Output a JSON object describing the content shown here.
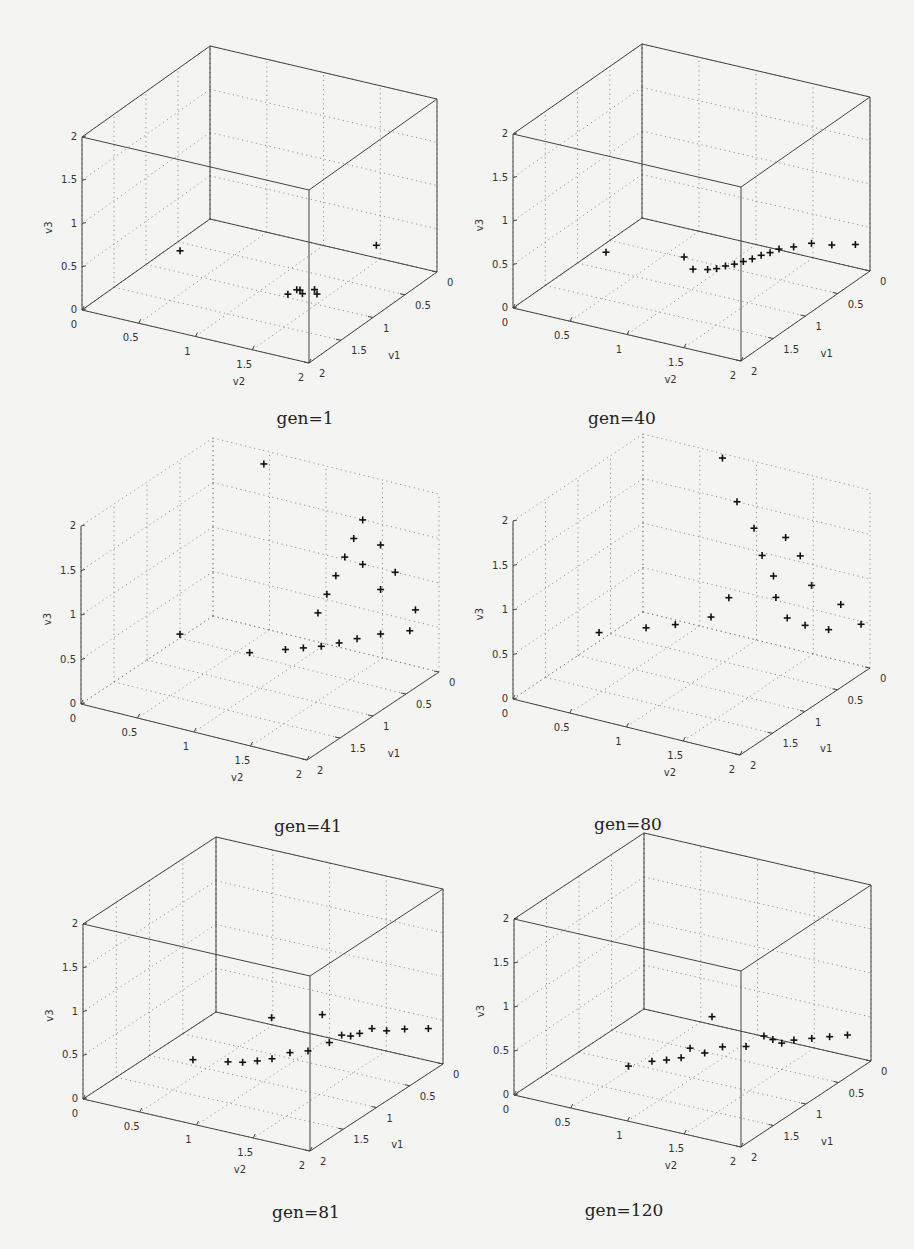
{
  "figure": {
    "panels": [
      {
        "caption": "gen=1"
      },
      {
        "caption": "gen=40"
      },
      {
        "caption": "gen=41"
      },
      {
        "caption": "gen=80"
      },
      {
        "caption": "gen=81"
      },
      {
        "caption": "gen=120"
      }
    ]
  },
  "chart_data": [
    {
      "type": "scatter3d",
      "title": "gen=1",
      "xlabel": "v1",
      "ylabel": "v2",
      "zlabel": "v3",
      "xlim": [
        0,
        2
      ],
      "ylim": [
        0,
        2
      ],
      "zlim": [
        0,
        2
      ],
      "ticks": [
        "0",
        "0.5",
        "1",
        "1.5",
        "2"
      ],
      "grid": true,
      "marker": "+",
      "points": [
        {
          "v1": 1.0,
          "v2": 0.3,
          "v3": 0.25
        },
        {
          "v1": 0.15,
          "v2": 1.55,
          "v3": 0.25
        },
        {
          "v1": 0.9,
          "v2": 1.3,
          "v3": 0.05
        },
        {
          "v1": 0.95,
          "v2": 1.35,
          "v3": 0.05
        },
        {
          "v1": 0.85,
          "v2": 1.4,
          "v3": 0.06
        },
        {
          "v1": 1.0,
          "v2": 1.25,
          "v3": 0.04
        },
        {
          "v1": 0.9,
          "v2": 1.45,
          "v3": 0.05
        },
        {
          "v1": 0.95,
          "v2": 1.3,
          "v3": 0.08
        }
      ]
    },
    {
      "type": "scatter3d",
      "title": "gen=40",
      "xlabel": "v1",
      "ylabel": "v2",
      "zlabel": "v3",
      "xlim": [
        0,
        2
      ],
      "ylim": [
        0,
        2
      ],
      "zlim": [
        0,
        2
      ],
      "ticks": [
        "0",
        "0.5",
        "1",
        "1.5",
        "2"
      ],
      "grid": true,
      "marker": "+",
      "points": [
        {
          "v1": 1.0,
          "v2": 0.25,
          "v3": 0.2
        },
        {
          "v1": 0.85,
          "v2": 0.85,
          "v3": 0.25
        },
        {
          "v1": 0.8,
          "v2": 0.9,
          "v3": 0.1
        },
        {
          "v1": 0.75,
          "v2": 1.0,
          "v3": 0.1
        },
        {
          "v1": 0.7,
          "v2": 1.05,
          "v3": 0.1
        },
        {
          "v1": 0.65,
          "v2": 1.1,
          "v3": 0.12
        },
        {
          "v1": 0.6,
          "v2": 1.15,
          "v3": 0.13
        },
        {
          "v1": 0.55,
          "v2": 1.2,
          "v3": 0.15
        },
        {
          "v1": 0.5,
          "v2": 1.25,
          "v3": 0.17
        },
        {
          "v1": 0.45,
          "v2": 1.3,
          "v3": 0.2
        },
        {
          "v1": 0.4,
          "v2": 1.35,
          "v3": 0.22
        },
        {
          "v1": 0.35,
          "v2": 1.4,
          "v3": 0.25
        },
        {
          "v1": 0.3,
          "v2": 1.5,
          "v3": 0.28
        },
        {
          "v1": 0.2,
          "v2": 1.6,
          "v3": 0.3
        },
        {
          "v1": 0.15,
          "v2": 1.75,
          "v3": 0.3
        },
        {
          "v1": 0.05,
          "v2": 1.9,
          "v3": 0.3
        }
      ]
    },
    {
      "type": "scatter3d",
      "title": "gen=41",
      "xlabel": "v1",
      "ylabel": "v2",
      "zlabel": "v3",
      "xlim": [
        0,
        2
      ],
      "ylim": [
        0,
        2
      ],
      "zlim": [
        0,
        2
      ],
      "ticks": [
        "0",
        "0.5",
        "1",
        "1.5",
        "2"
      ],
      "grid": true,
      "marker": "+",
      "description": "Points form a curved band near v3≈0.3 plus a vertical sheet rising to v3≈1.8 around v2≈1.2–1.6",
      "points": [
        {
          "v1": 1.1,
          "v2": 0.35,
          "v3": 0.45
        },
        {
          "v1": 0.0,
          "v2": 0.45,
          "v3": 1.85
        },
        {
          "v1": 0.9,
          "v2": 0.85,
          "v3": 0.3
        },
        {
          "v1": 0.7,
          "v2": 1.05,
          "v3": 0.3
        },
        {
          "v1": 0.6,
          "v2": 1.15,
          "v3": 0.3
        },
        {
          "v1": 0.5,
          "v2": 1.25,
          "v3": 0.3
        },
        {
          "v1": 0.4,
          "v2": 1.35,
          "v3": 0.32
        },
        {
          "v1": 0.3,
          "v2": 1.45,
          "v3": 0.35
        },
        {
          "v1": 0.2,
          "v2": 1.6,
          "v3": 0.4
        },
        {
          "v1": 0.1,
          "v2": 1.8,
          "v3": 0.45
        },
        {
          "v1": 0.3,
          "v2": 1.5,
          "v3": 1.7
        },
        {
          "v1": 0.35,
          "v2": 1.45,
          "v3": 1.5
        },
        {
          "v1": 0.4,
          "v2": 1.4,
          "v3": 1.3
        },
        {
          "v1": 0.45,
          "v2": 1.35,
          "v3": 1.1
        },
        {
          "v1": 0.5,
          "v2": 1.3,
          "v3": 0.9
        },
        {
          "v1": 0.55,
          "v2": 1.25,
          "v3": 0.7
        },
        {
          "v1": 0.2,
          "v2": 1.6,
          "v3": 1.4
        },
        {
          "v1": 0.15,
          "v2": 1.7,
          "v3": 1.1
        },
        {
          "v1": 0.2,
          "v2": 1.6,
          "v3": 0.9
        },
        {
          "v1": 0.3,
          "v2": 1.5,
          "v3": 1.2
        },
        {
          "v1": 0.1,
          "v2": 1.85,
          "v3": 0.7
        }
      ]
    },
    {
      "type": "scatter3d",
      "title": "gen=80",
      "xlabel": "v1",
      "ylabel": "v2",
      "zlabel": "v3",
      "xlim": [
        0,
        2
      ],
      "ylim": [
        0,
        2
      ],
      "zlim": [
        0,
        2
      ],
      "ticks": [
        "0",
        "0.5",
        "1",
        "1.5",
        "2"
      ],
      "grid": true,
      "marker": "+",
      "description": "Dense triangular sheet of points spanning v3 from ~0.3 to ~1.9",
      "points": [
        {
          "v1": 0.0,
          "v2": 0.7,
          "v3": 1.95
        },
        {
          "v1": 1.2,
          "v2": 0.3,
          "v3": 0.45
        },
        {
          "v1": 1.0,
          "v2": 0.6,
          "v3": 0.5
        },
        {
          "v1": 0.9,
          "v2": 0.8,
          "v3": 0.55
        },
        {
          "v1": 0.7,
          "v2": 1.0,
          "v3": 0.6
        },
        {
          "v1": 0.6,
          "v2": 1.1,
          "v3": 0.8
        },
        {
          "v1": 0.3,
          "v2": 1.0,
          "v3": 1.7
        },
        {
          "v1": 0.3,
          "v2": 1.15,
          "v3": 1.45
        },
        {
          "v1": 0.35,
          "v2": 1.25,
          "v3": 1.2
        },
        {
          "v1": 0.35,
          "v2": 1.35,
          "v3": 1.0
        },
        {
          "v1": 0.4,
          "v2": 1.4,
          "v3": 0.8
        },
        {
          "v1": 0.4,
          "v2": 1.5,
          "v3": 0.6
        },
        {
          "v1": 0.3,
          "v2": 1.6,
          "v3": 0.5
        },
        {
          "v1": 0.2,
          "v2": 1.75,
          "v3": 0.45
        },
        {
          "v1": 0.2,
          "v2": 1.5,
          "v3": 1.2
        },
        {
          "v1": 0.2,
          "v2": 1.6,
          "v3": 0.9
        },
        {
          "v1": 0.25,
          "v2": 1.4,
          "v3": 1.4
        },
        {
          "v1": 0.1,
          "v2": 1.8,
          "v3": 0.7
        },
        {
          "v1": 0.05,
          "v2": 1.95,
          "v3": 0.5
        }
      ]
    },
    {
      "type": "scatter3d",
      "title": "gen=81",
      "xlabel": "v1",
      "ylabel": "v2",
      "zlabel": "v3",
      "xlim": [
        0,
        2
      ],
      "ylim": [
        0,
        2
      ],
      "zlim": [
        0,
        2
      ],
      "ticks": [
        "0",
        "0.5",
        "1",
        "1.5",
        "2"
      ],
      "grid": true,
      "marker": "+",
      "points": [
        {
          "v1": 1.2,
          "v2": 0.5,
          "v3": 0.2
        },
        {
          "v1": 1.1,
          "v2": 0.75,
          "v3": 0.2
        },
        {
          "v1": 1.05,
          "v2": 0.85,
          "v3": 0.2
        },
        {
          "v1": 1.0,
          "v2": 0.95,
          "v3": 0.22
        },
        {
          "v1": 0.95,
          "v2": 1.05,
          "v3": 0.25
        },
        {
          "v1": 0.85,
          "v2": 1.15,
          "v3": 0.3
        },
        {
          "v1": 0.7,
          "v2": 0.9,
          "v3": 0.55
        },
        {
          "v1": 0.75,
          "v2": 1.25,
          "v3": 0.3
        },
        {
          "v1": 0.6,
          "v2": 1.35,
          "v3": 0.35
        },
        {
          "v1": 0.5,
          "v2": 1.4,
          "v3": 0.4
        },
        {
          "v1": 0.45,
          "v2": 1.45,
          "v3": 0.38
        },
        {
          "v1": 0.4,
          "v2": 1.5,
          "v3": 0.4
        },
        {
          "v1": 0.3,
          "v2": 1.55,
          "v3": 0.42
        },
        {
          "v1": 0.25,
          "v2": 1.65,
          "v3": 0.4
        },
        {
          "v1": 0.15,
          "v2": 1.75,
          "v3": 0.4
        },
        {
          "v1": 0.05,
          "v2": 1.9,
          "v3": 0.4
        },
        {
          "v1": 0.45,
          "v2": 1.2,
          "v3": 0.55
        }
      ]
    },
    {
      "type": "scatter3d",
      "title": "gen=120",
      "xlabel": "v1",
      "ylabel": "v2",
      "zlabel": "v3",
      "xlim": [
        0,
        2
      ],
      "ylim": [
        0,
        2
      ],
      "zlim": [
        0,
        2
      ],
      "ticks": [
        "0",
        "0.5",
        "1",
        "1.5",
        "2"
      ],
      "grid": true,
      "marker": "+",
      "points": [
        {
          "v1": 1.2,
          "v2": 0.55,
          "v3": 0.1
        },
        {
          "v1": 1.1,
          "v2": 0.7,
          "v3": 0.15
        },
        {
          "v1": 1.05,
          "v2": 0.8,
          "v3": 0.17
        },
        {
          "v1": 1.0,
          "v2": 0.9,
          "v3": 0.2
        },
        {
          "v1": 0.95,
          "v2": 0.95,
          "v3": 0.3
        },
        {
          "v1": 0.9,
          "v2": 1.05,
          "v3": 0.25
        },
        {
          "v1": 0.8,
          "v2": 1.15,
          "v3": 0.3
        },
        {
          "v1": 0.7,
          "v2": 1.3,
          "v3": 0.3
        },
        {
          "v1": 0.6,
          "v2": 1.4,
          "v3": 0.4
        },
        {
          "v1": 0.55,
          "v2": 1.45,
          "v3": 0.35
        },
        {
          "v1": 0.5,
          "v2": 1.5,
          "v3": 0.3
        },
        {
          "v1": 0.4,
          "v2": 1.55,
          "v3": 0.3
        },
        {
          "v1": 0.3,
          "v2": 1.65,
          "v3": 0.3
        },
        {
          "v1": 0.2,
          "v2": 1.75,
          "v3": 0.3
        },
        {
          "v1": 0.1,
          "v2": 1.85,
          "v3": 0.3
        },
        {
          "v1": 0.7,
          "v2": 1.0,
          "v3": 0.55
        }
      ]
    }
  ]
}
